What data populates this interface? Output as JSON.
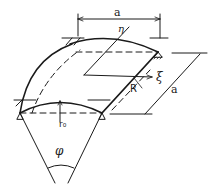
{
  "figure": {
    "labels": {
      "span_top": "a",
      "span_side": "a",
      "eta_axis": "η",
      "xi_axis": "ξ",
      "radius": "R",
      "rise": "r₀",
      "angle": "φ"
    },
    "colors": {
      "line": "#1a1a1a",
      "background": "#ffffff"
    }
  }
}
